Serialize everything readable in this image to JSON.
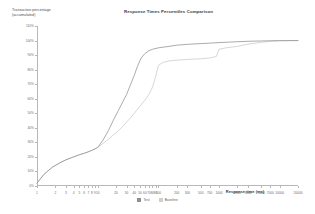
{
  "chart_data": {
    "type": "line",
    "title": "Response Times Percentiles Comparison",
    "xlabel": "Response time (ms)",
    "ylabel": "Transaction percentage\n(accumulated)",
    "grid": false,
    "legend_position": "bottom-center",
    "xscale": "log",
    "xticks": [
      "1",
      "2",
      "3",
      "4",
      "5",
      "6",
      "7",
      "8",
      "9",
      "10",
      "20",
      "30",
      "40",
      "50",
      "60",
      "70",
      "80",
      "90",
      "100",
      "200",
      "300",
      "500",
      "700",
      "1000",
      "2000",
      "3000",
      "5000",
      "7000",
      "10000",
      "20000"
    ],
    "xtick_labels": [
      "1",
      "2",
      "3",
      "4",
      "5",
      "6",
      "7",
      "8",
      "9",
      "10",
      "20",
      "30",
      "40",
      "50",
      "60",
      "70",
      "80",
      "90",
      "100",
      "200",
      "300",
      "500",
      "700",
      "1000",
      "2000",
      "3000",
      "5000",
      "7000",
      "10000",
      "20000"
    ],
    "yticks": [
      "0%",
      "10%",
      "20%",
      "30%",
      "40%",
      "50%",
      "60%",
      "70%",
      "80%",
      "90%",
      "100%",
      "110%"
    ],
    "ylim": [
      0,
      110
    ],
    "series": [
      {
        "name": "Test",
        "color": "#8f8f8f",
        "points": [
          [
            1,
            2
          ],
          [
            1.3,
            8
          ],
          [
            1.8,
            13
          ],
          [
            2.4,
            16
          ],
          [
            3,
            18
          ],
          [
            4,
            20
          ],
          [
            5,
            21.5
          ],
          [
            6,
            22.5
          ],
          [
            7,
            23.5
          ],
          [
            8,
            24.5
          ],
          [
            9,
            25.5
          ],
          [
            10,
            26.5
          ],
          [
            12,
            31
          ],
          [
            15,
            38
          ],
          [
            18,
            45
          ],
          [
            22,
            52
          ],
          [
            26,
            58
          ],
          [
            30,
            63
          ],
          [
            35,
            70
          ],
          [
            40,
            76
          ],
          [
            45,
            82
          ],
          [
            52,
            88
          ],
          [
            60,
            91
          ],
          [
            70,
            93
          ],
          [
            80,
            94
          ],
          [
            100,
            95
          ],
          [
            150,
            96
          ],
          [
            200,
            96.8
          ],
          [
            300,
            97.4
          ],
          [
            500,
            97.9
          ],
          [
            700,
            98.2
          ],
          [
            1000,
            98.6
          ],
          [
            2000,
            99.2
          ],
          [
            3000,
            99.5
          ],
          [
            5000,
            99.7
          ],
          [
            7000,
            99.85
          ],
          [
            10000,
            99.95
          ],
          [
            20000,
            100
          ]
        ]
      },
      {
        "name": "Baseline",
        "color": "#c9c9c9",
        "points": [
          [
            1,
            2
          ],
          [
            1.3,
            8
          ],
          [
            1.8,
            13
          ],
          [
            2.4,
            16
          ],
          [
            3,
            18
          ],
          [
            4,
            20
          ],
          [
            5,
            21.5
          ],
          [
            6,
            22.5
          ],
          [
            7,
            23.5
          ],
          [
            8,
            24.5
          ],
          [
            9,
            25.5
          ],
          [
            10,
            26.5
          ],
          [
            12,
            29
          ],
          [
            15,
            32
          ],
          [
            18,
            35
          ],
          [
            22,
            38
          ],
          [
            26,
            41
          ],
          [
            30,
            44
          ],
          [
            35,
            47
          ],
          [
            40,
            50
          ],
          [
            50,
            55
          ],
          [
            60,
            59
          ],
          [
            70,
            63
          ],
          [
            80,
            68
          ],
          [
            90,
            75
          ],
          [
            100,
            83
          ],
          [
            120,
            85
          ],
          [
            150,
            86
          ],
          [
            200,
            86.5
          ],
          [
            300,
            87
          ],
          [
            500,
            87.5
          ],
          [
            700,
            88
          ],
          [
            900,
            89
          ],
          [
            1000,
            94
          ],
          [
            1300,
            95
          ],
          [
            2000,
            96
          ],
          [
            3000,
            97.5
          ],
          [
            5000,
            98.8
          ],
          [
            7000,
            99.4
          ],
          [
            10000,
            99.8
          ],
          [
            20000,
            100
          ]
        ]
      }
    ]
  },
  "legend": {
    "items": [
      {
        "label": "Test",
        "color": "#8f8f8f"
      },
      {
        "label": "Baseline",
        "color": "#cfcfcf"
      }
    ]
  }
}
